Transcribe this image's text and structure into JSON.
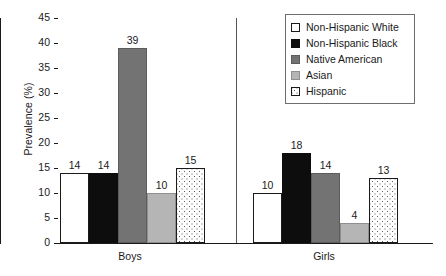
{
  "chart_data": {
    "type": "bar",
    "title": "",
    "xlabel": "",
    "ylabel": "Prevalence (%)",
    "ylim": [
      0,
      45
    ],
    "yticks": [
      0,
      5,
      10,
      15,
      20,
      25,
      30,
      35,
      40,
      45
    ],
    "ytick_labels": [
      "0",
      "5",
      "10",
      "15",
      "20",
      "25",
      "30",
      "35",
      "40",
      "45"
    ],
    "grid": false,
    "legend_position": "top-right",
    "categories": [
      "Boys",
      "Girls"
    ],
    "series": [
      {
        "name": "Non-Hispanic White",
        "values": [
          14,
          10
        ],
        "color": "#ffffff",
        "pattern": "solid-outline"
      },
      {
        "name": "Non-Hispanic Black",
        "values": [
          14,
          18
        ],
        "color": "#0d0d0d",
        "pattern": "solid"
      },
      {
        "name": "Native American",
        "values": [
          39,
          14
        ],
        "color": "#737373",
        "pattern": "solid"
      },
      {
        "name": "Asian",
        "values": [
          10,
          4
        ],
        "color": "#b5b5b5",
        "pattern": "solid"
      },
      {
        "name": "Hispanic",
        "values": [
          15,
          13
        ],
        "color": "#ffffff",
        "pattern": "dotted"
      }
    ],
    "data_labels": {
      "Boys": [
        "14",
        "14",
        "39",
        "10",
        "15"
      ],
      "Girls": [
        "10",
        "18",
        "14",
        "4",
        "13"
      ]
    }
  },
  "axis": {
    "y_title": "Prevalence (%)"
  },
  "legend": {
    "items": [
      {
        "label": "Non-Hispanic White",
        "swatch": "legend-swatch-non-hispanic-white"
      },
      {
        "label": "Non-Hispanic Black",
        "swatch": "legend-swatch-non-hispanic-black"
      },
      {
        "label": "Native American",
        "swatch": "legend-swatch-native-american"
      },
      {
        "label": "Asian",
        "swatch": "legend-swatch-asian"
      },
      {
        "label": "Hispanic",
        "swatch": "legend-swatch-hispanic"
      }
    ]
  },
  "groups": [
    {
      "label": "Boys"
    },
    {
      "label": "Girls"
    }
  ]
}
